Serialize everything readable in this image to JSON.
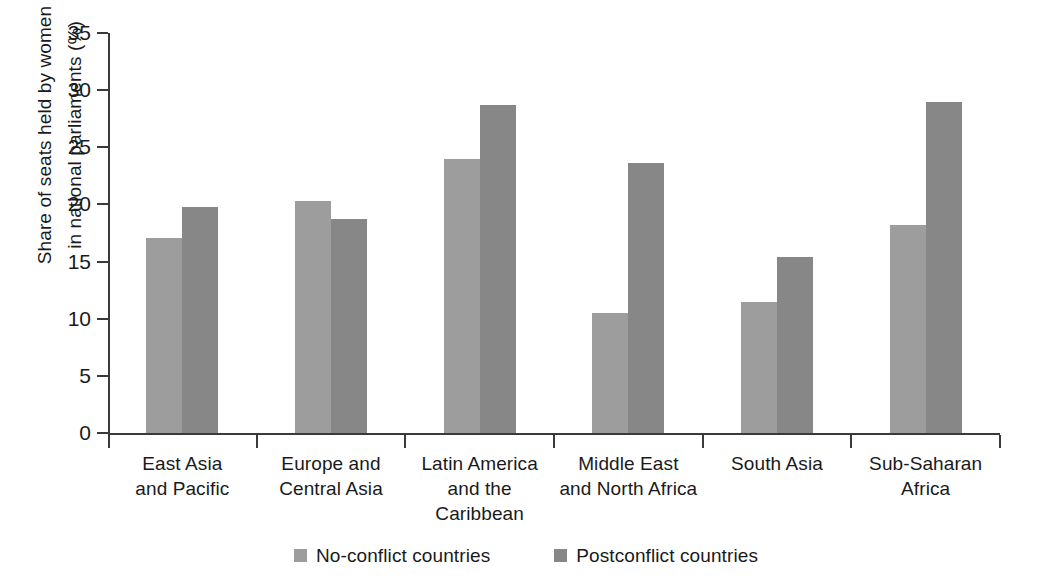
{
  "chart_data": {
    "type": "bar",
    "title": "",
    "xlabel": "",
    "ylabel": "Share of seats held by women\nin national parliaments (%)",
    "ylim": [
      0,
      35
    ],
    "ytick_step": 5,
    "ytick_labels": [
      "0",
      "5",
      "10",
      "15",
      "20",
      "25",
      "30",
      "35"
    ],
    "grid": false,
    "legend_position": "bottom-center",
    "categories": [
      "East Asia\nand Pacific",
      "Europe and\nCentral Asia",
      "Latin America\nand the\nCaribbean",
      "Middle East\nand North Africa",
      "South Asia",
      "Sub-Saharan\nAfrica"
    ],
    "series": [
      {
        "name": "No-conflict countries",
        "color": "#9d9d9d",
        "values": [
          17.1,
          20.3,
          24.0,
          10.5,
          11.5,
          18.2
        ]
      },
      {
        "name": "Postconflict countries",
        "color": "#878787",
        "values": [
          19.8,
          18.7,
          28.7,
          23.6,
          15.4,
          29.0
        ]
      }
    ]
  }
}
